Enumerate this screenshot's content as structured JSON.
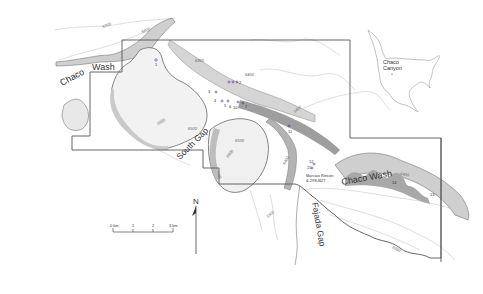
{
  "map": {
    "features": {
      "chaco_wash_nw_1": "Chaco",
      "chaco_wash_nw_2": "Wash",
      "south_gap": "South Gap",
      "fajada_gap": "Fajada Gap",
      "chaco_wash_se": "Chaco Wash",
      "marcia_rincon_1": "Marcias Rincon",
      "marcia_rincon_2": "& 29SJ627"
    },
    "contours": {
      "c1": "6300",
      "c2": "6400",
      "c3": "6300",
      "c4": "6400",
      "c5": "6500",
      "c6": "6500",
      "c7": "6400",
      "c8": "6500",
      "c9": "6400",
      "c10": "6500",
      "c11": "6400",
      "c12": "6300",
      "c13": "6500"
    },
    "sites": [
      "1",
      "2",
      "3",
      "4",
      "5",
      "6",
      "7",
      "8",
      "9",
      "10",
      "11",
      "12",
      "13",
      "14",
      "15",
      "16"
    ],
    "inset": {
      "label_1": "Chaco",
      "label_2": "Canyon"
    },
    "scale_bar": {
      "t0": "0 km",
      "t1": "1",
      "t2": "2",
      "t3": "3 km"
    },
    "north_arrow": {
      "label": "N"
    },
    "colors": {
      "boundary": "#555555",
      "contour": "#bbbbbb",
      "cliff": "#999999",
      "shade": "#d9d9d9",
      "site": "#553388"
    }
  }
}
